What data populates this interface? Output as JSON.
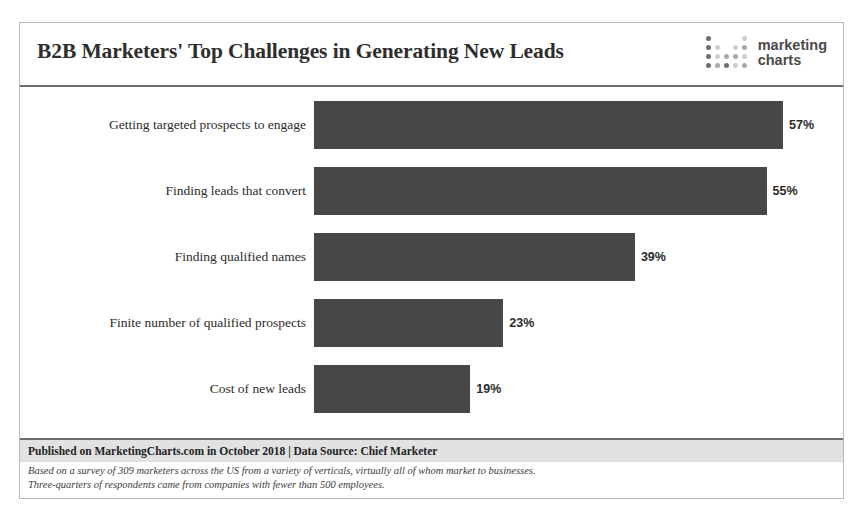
{
  "header": {
    "title": "B2B Marketers' Top Challenges in Generating New Leads",
    "logo": {
      "line1": "marketing",
      "line2": "charts",
      "icon": "dot-grid-logo-icon"
    }
  },
  "footer": {
    "published": "Published on MarketingCharts.com in October 2018 | Data Source: Chief Marketer",
    "note_line_1": "Based on a survey of 309 marketers across the US from a variety of verticals, virtually all of whom market to businesses.",
    "note_line_2": "Three-quarters of respondents came from companies with fewer than 500 employees."
  },
  "colors": {
    "bar": "#474747",
    "band": "#e2e2e2",
    "rule": "#6f6f6f",
    "text": "#2b2b2b"
  },
  "chart_data": {
    "type": "bar",
    "orientation": "horizontal",
    "title": "B2B Marketers' Top Challenges in Generating New Leads",
    "xlabel": "",
    "ylabel": "",
    "xlim": [
      0,
      60
    ],
    "grid": false,
    "legend": false,
    "categories": [
      "Getting targeted prospects to engage",
      "Finding leads that convert",
      "Finding qualified names",
      "Finite number of qualified prospects",
      "Cost of new leads"
    ],
    "values": [
      57,
      55,
      39,
      23,
      19
    ],
    "value_labels": [
      "57%",
      "55%",
      "39%",
      "23%",
      "19%"
    ]
  }
}
